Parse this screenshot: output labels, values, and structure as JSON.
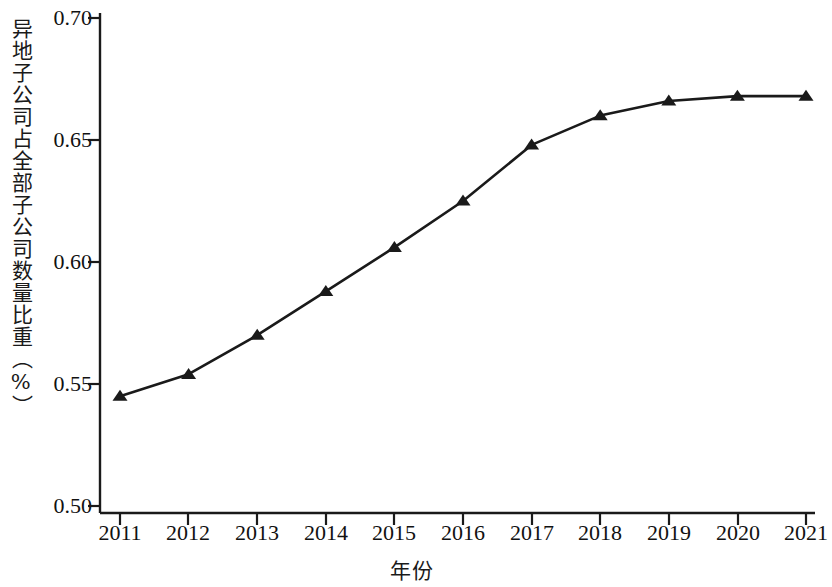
{
  "chart_data": {
    "type": "line",
    "title": "",
    "xlabel": "年份",
    "ylabel": "异地子公司占全部子公司数量比重（%）",
    "categories": [
      "2011",
      "2012",
      "2013",
      "2014",
      "2015",
      "2016",
      "2017",
      "2018",
      "2019",
      "2020",
      "2021"
    ],
    "x": [
      2011,
      2012,
      2013,
      2014,
      2015,
      2016,
      2017,
      2018,
      2019,
      2020,
      2021
    ],
    "values": [
      0.545,
      0.554,
      0.57,
      0.588,
      0.606,
      0.625,
      0.648,
      0.66,
      0.666,
      0.668,
      0.668
    ],
    "series": [
      {
        "name": "异地子公司占全部子公司数量比重",
        "values": [
          0.545,
          0.554,
          0.57,
          0.588,
          0.606,
          0.625,
          0.648,
          0.66,
          0.666,
          0.668,
          0.668
        ]
      }
    ],
    "ylim": [
      0.5,
      0.7
    ],
    "xlim": [
      2011,
      2021
    ],
    "yticks": [
      "0.50",
      "0.55",
      "0.60",
      "0.65",
      "0.70"
    ],
    "ytick_values": [
      0.5,
      0.55,
      0.6,
      0.65,
      0.7
    ],
    "grid": false,
    "legend": false,
    "legend_position": "none",
    "marker": "triangle",
    "line_color": "#1a1a1a",
    "marker_color": "#1a1a1a",
    "background_color": "#ffffff"
  }
}
